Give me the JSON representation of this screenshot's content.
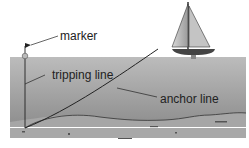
{
  "diagram": {
    "labels": {
      "marker": "marker",
      "tripping_line": "tripping line",
      "anchor_line": "anchor line"
    },
    "colors": {
      "water_top": "#b9b9b9",
      "water_bottom": "#8e8e8e",
      "seabed": "#a9a9a9",
      "line": "#222222",
      "background": "#ffffff"
    }
  }
}
